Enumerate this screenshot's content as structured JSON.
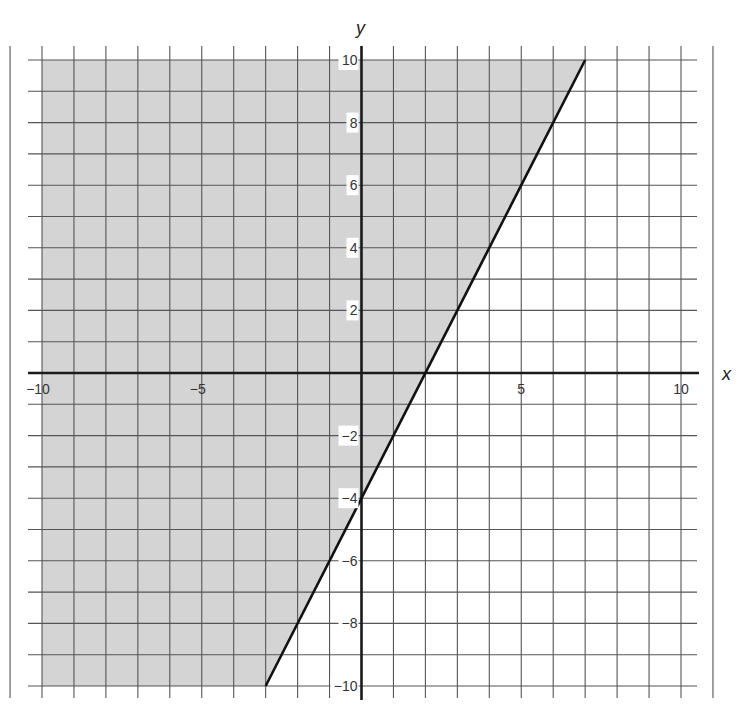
{
  "chart_data": {
    "type": "line",
    "title": "",
    "xlabel": "x",
    "ylabel": "y",
    "xlim": [
      -10,
      10
    ],
    "ylim": [
      -10,
      10
    ],
    "grid": true,
    "grid_step": 1,
    "x_ticks": [
      {
        "value": -10,
        "label": "-10"
      },
      {
        "value": -5,
        "label": "-5"
      },
      {
        "value": 5,
        "label": "5"
      },
      {
        "value": 10,
        "label": "10"
      }
    ],
    "y_ticks": [
      {
        "value": 10,
        "label": "10"
      },
      {
        "value": 8,
        "label": "8"
      },
      {
        "value": 6,
        "label": "6"
      },
      {
        "value": 4,
        "label": "4"
      },
      {
        "value": 2,
        "label": "2"
      },
      {
        "value": -2,
        "label": "-2"
      },
      {
        "value": -4,
        "label": "-4"
      },
      {
        "value": -6,
        "label": "-6"
      },
      {
        "value": -8,
        "label": "-8"
      },
      {
        "value": -10,
        "label": "-10"
      }
    ],
    "series": [
      {
        "name": "boundary line y = 2x - 4",
        "style": "solid",
        "points": [
          [
            -3,
            -10
          ],
          [
            7,
            10
          ]
        ]
      }
    ],
    "shaded_region": {
      "description": "y >= 2x - 4 (region above/left of line)",
      "polygon": [
        [
          -10,
          10
        ],
        [
          7,
          10
        ],
        [
          -3,
          -10
        ],
        [
          -10,
          -10
        ]
      ]
    },
    "key_points": [
      {
        "x": 2,
        "y": 0,
        "label": "x-intercept"
      },
      {
        "x": 0,
        "y": -4,
        "label": "y-intercept"
      }
    ],
    "colors": {
      "shade": "#d4d4d4",
      "grid": "#555555",
      "axis": "#1a1a1a",
      "line": "#111111"
    }
  }
}
